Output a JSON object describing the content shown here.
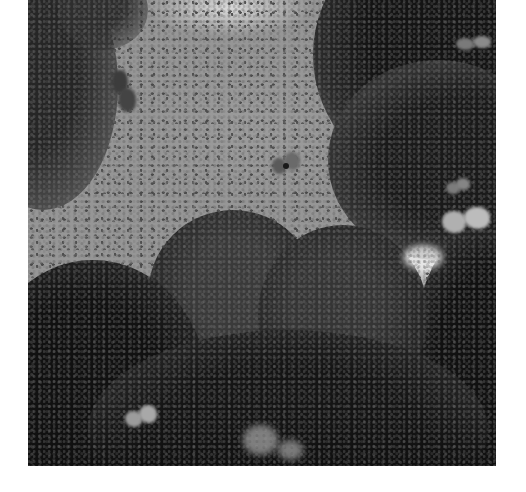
{
  "image": {
    "description": "Black-and-white photograph looking up through a forest canopy at a sky filled with swarming butterflies",
    "style": "grayscale",
    "frame": {
      "background": "#ffffff",
      "photo_box": {
        "x": 28,
        "y": 0,
        "width": 468,
        "height": 466
      }
    },
    "colors": {
      "sky": "#999999",
      "sky_highlight": "#e0e0e0",
      "foliage_dark": "#141414",
      "foliage_mid": "#3a3a3a",
      "butterfly_pale": "#b8b8b8",
      "butterfly_dark": "#3c3c3c"
    },
    "regions": [
      {
        "name": "sky",
        "description": "gray sky filled with thousands of small dark butterfly silhouettes"
      },
      {
        "name": "left-canopy",
        "description": "dark foliage along the upper-left edge"
      },
      {
        "name": "right-canopy",
        "description": "dense dark tree canopy on the right side, top to bottom"
      },
      {
        "name": "center-tree",
        "description": "rounded tree crown rising from the bottom center"
      },
      {
        "name": "bottom-foliage",
        "description": "very dark foliage along the bottom with bright light gaps"
      }
    ],
    "butterflies_prominent": [
      {
        "label": "blurred-dark-butterfly-left",
        "x": 122,
        "y": 90
      },
      {
        "label": "blurred-butterfly-center",
        "x": 287,
        "y": 165
      },
      {
        "label": "pale-butterfly-right-top",
        "x": 470,
        "y": 43
      },
      {
        "label": "pale-butterfly-right-mid",
        "x": 465,
        "y": 215
      },
      {
        "label": "pale-butterfly-right-small",
        "x": 455,
        "y": 188
      },
      {
        "label": "pale-butterfly-bottom-left",
        "x": 138,
        "y": 418
      }
    ]
  }
}
